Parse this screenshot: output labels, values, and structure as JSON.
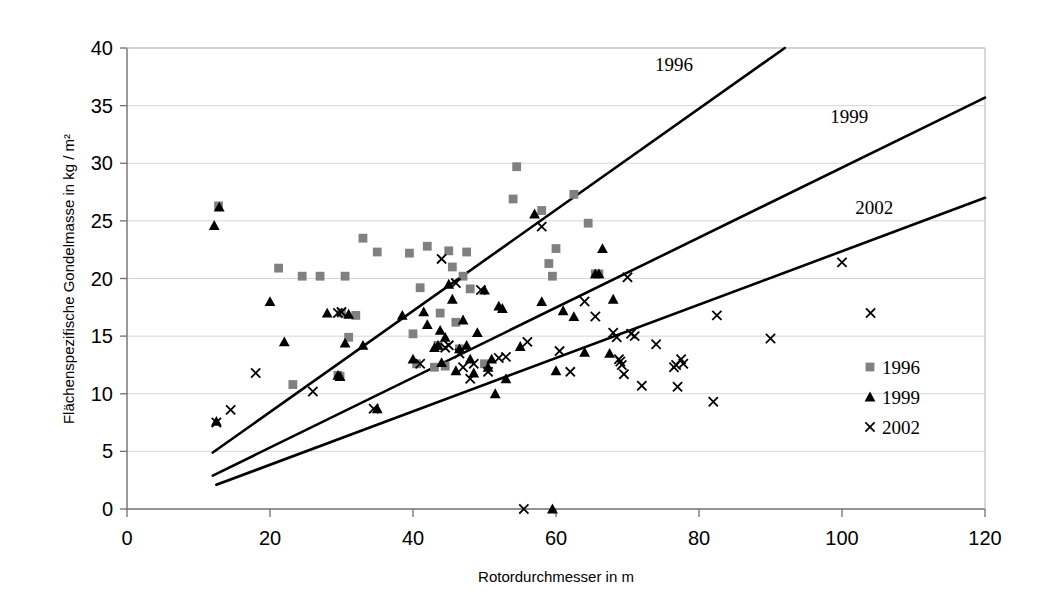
{
  "chart_data": {
    "type": "scatter",
    "title": "",
    "xlabel": "Rotordurchmesser in m",
    "ylabel": "Flächenspezifische Gondelmasse in kg / m²",
    "xlim": [
      0,
      120
    ],
    "ylim": [
      0,
      40
    ],
    "xticks": [
      0,
      20,
      40,
      60,
      80,
      100,
      120
    ],
    "yticks": [
      0,
      5,
      10,
      15,
      20,
      25,
      30,
      35,
      40
    ],
    "grid": "horizontal",
    "legend_position": "right-inside",
    "legend": [
      {
        "label": "1996",
        "marker": "square",
        "color": "#808080"
      },
      {
        "label": "1999",
        "marker": "triangle",
        "color": "#000000"
      },
      {
        "label": "2002",
        "marker": "cross",
        "color": "#000000"
      }
    ],
    "series": [
      {
        "name": "1996",
        "marker": "square",
        "color": "#808080",
        "points": [
          [
            12.8,
            26.3
          ],
          [
            21.2,
            20.9
          ],
          [
            23.2,
            10.8
          ],
          [
            24.5,
            20.2
          ],
          [
            27.0,
            20.2
          ],
          [
            29.5,
            11.6
          ],
          [
            29.8,
            11.5
          ],
          [
            30.0,
            17.0
          ],
          [
            30.5,
            20.2
          ],
          [
            31.0,
            14.9
          ],
          [
            32.0,
            16.8
          ],
          [
            33.0,
            23.5
          ],
          [
            35.0,
            22.3
          ],
          [
            39.5,
            22.2
          ],
          [
            40.0,
            15.2
          ],
          [
            40.5,
            12.6
          ],
          [
            41.0,
            19.2
          ],
          [
            42.0,
            22.8
          ],
          [
            43.0,
            12.3
          ],
          [
            43.5,
            14.2
          ],
          [
            43.8,
            17.0
          ],
          [
            44.5,
            12.4
          ],
          [
            45.0,
            22.4
          ],
          [
            45.5,
            21.0
          ],
          [
            46.0,
            16.2
          ],
          [
            46.5,
            13.9
          ],
          [
            47.0,
            20.2
          ],
          [
            47.5,
            22.3
          ],
          [
            48.0,
            19.1
          ],
          [
            50.0,
            12.6
          ],
          [
            54.5,
            29.7
          ],
          [
            54.0,
            26.9
          ],
          [
            58.0,
            25.9
          ],
          [
            59.0,
            21.3
          ],
          [
            59.5,
            20.2
          ],
          [
            60.0,
            22.6
          ],
          [
            62.5,
            27.3
          ],
          [
            64.5,
            24.8
          ],
          [
            65.5,
            20.4
          ],
          [
            66.0,
            20.4
          ]
        ]
      },
      {
        "name": "1999",
        "marker": "triangle",
        "color": "#000000",
        "points": [
          [
            12.2,
            24.6
          ],
          [
            12.9,
            26.2
          ],
          [
            12.5,
            7.6
          ],
          [
            20.0,
            18.0
          ],
          [
            22.0,
            14.5
          ],
          [
            28.0,
            17.0
          ],
          [
            29.5,
            11.6
          ],
          [
            29.8,
            11.5
          ],
          [
            30.5,
            14.4
          ],
          [
            31.0,
            16.9
          ],
          [
            33.0,
            14.2
          ],
          [
            35.0,
            8.7
          ],
          [
            38.5,
            16.8
          ],
          [
            40.0,
            13.0
          ],
          [
            41.5,
            17.1
          ],
          [
            42.0,
            16.0
          ],
          [
            43.0,
            14.0
          ],
          [
            43.5,
            14.2
          ],
          [
            43.8,
            15.5
          ],
          [
            44.0,
            12.7
          ],
          [
            44.5,
            14.9
          ],
          [
            45.0,
            19.5
          ],
          [
            45.5,
            18.2
          ],
          [
            46.0,
            12.0
          ],
          [
            46.5,
            13.9
          ],
          [
            47.0,
            16.4
          ],
          [
            47.5,
            14.2
          ],
          [
            48.0,
            13.0
          ],
          [
            48.5,
            11.8
          ],
          [
            49.0,
            15.3
          ],
          [
            50.0,
            19.0
          ],
          [
            50.5,
            12.3
          ],
          [
            51.0,
            13.0
          ],
          [
            51.5,
            10.0
          ],
          [
            52.0,
            17.6
          ],
          [
            52.5,
            17.4
          ],
          [
            53.0,
            11.3
          ],
          [
            55.0,
            14.1
          ],
          [
            57.0,
            25.6
          ],
          [
            58.0,
            18.0
          ],
          [
            59.5,
            0.0
          ],
          [
            60.0,
            12.0
          ],
          [
            61.0,
            17.2
          ],
          [
            62.5,
            16.7
          ],
          [
            64.0,
            13.6
          ],
          [
            65.5,
            20.4
          ],
          [
            66.0,
            20.4
          ],
          [
            66.5,
            22.6
          ],
          [
            67.5,
            13.5
          ],
          [
            68.0,
            18.2
          ]
        ]
      },
      {
        "name": "2002",
        "marker": "cross",
        "color": "#000000",
        "points": [
          [
            12.5,
            7.5
          ],
          [
            14.5,
            8.6
          ],
          [
            18.0,
            11.8
          ],
          [
            26.0,
            10.2
          ],
          [
            29.5,
            17.0
          ],
          [
            30.0,
            17.1
          ],
          [
            34.5,
            8.7
          ],
          [
            41.0,
            12.6
          ],
          [
            44.0,
            21.7
          ],
          [
            44.5,
            14.0
          ],
          [
            45.0,
            14.2
          ],
          [
            46.0,
            19.6
          ],
          [
            46.5,
            13.5
          ],
          [
            47.0,
            12.3
          ],
          [
            48.0,
            11.3
          ],
          [
            48.5,
            12.6
          ],
          [
            49.5,
            19.0
          ],
          [
            50.5,
            11.9
          ],
          [
            52.0,
            13.1
          ],
          [
            53.0,
            13.2
          ],
          [
            55.5,
            0.0
          ],
          [
            56.0,
            14.5
          ],
          [
            58.0,
            24.5
          ],
          [
            60.5,
            13.7
          ],
          [
            62.0,
            11.9
          ],
          [
            64.0,
            18.0
          ],
          [
            65.5,
            16.7
          ],
          [
            68.0,
            15.3
          ],
          [
            68.5,
            14.9
          ],
          [
            68.8,
            13.0
          ],
          [
            69.0,
            12.8
          ],
          [
            69.2,
            12.5
          ],
          [
            69.5,
            11.7
          ],
          [
            70.0,
            20.1
          ],
          [
            70.5,
            15.2
          ],
          [
            71.0,
            15.0
          ],
          [
            72.0,
            10.7
          ],
          [
            74.0,
            14.3
          ],
          [
            76.5,
            12.3
          ],
          [
            76.8,
            12.5
          ],
          [
            77.0,
            10.6
          ],
          [
            77.5,
            13.0
          ],
          [
            77.8,
            12.6
          ],
          [
            82.0,
            9.3
          ],
          [
            82.5,
            16.8
          ],
          [
            90.0,
            14.8
          ],
          [
            100.0,
            21.4
          ],
          [
            104.0,
            17.0
          ]
        ]
      }
    ],
    "trend_lines": [
      {
        "label": "1996",
        "x0": 12.0,
        "y0": 4.9,
        "x1": 92.0,
        "y1": 40.0
      },
      {
        "label": "1999",
        "x0": 12.0,
        "y0": 2.9,
        "x1": 120.0,
        "y1": 35.7
      },
      {
        "label": "2002",
        "x0": 12.5,
        "y0": 2.1,
        "x1": 120.0,
        "y1": 27.0
      }
    ],
    "trend_line_labels": [
      {
        "text": "1996",
        "x": 76.5,
        "y": 38.0
      },
      {
        "text": "1999",
        "x": 101.0,
        "y": 33.5
      },
      {
        "text": "2002",
        "x": 104.5,
        "y": 25.6
      }
    ]
  }
}
